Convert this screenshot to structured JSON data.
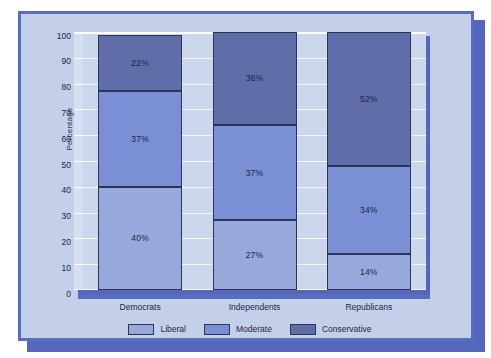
{
  "chart_data": {
    "type": "bar",
    "subtype": "stacked-100-percent",
    "title": "",
    "subtitle": "",
    "xlabel": "",
    "ylabel": "Percentage",
    "categories": [
      "Democrats",
      "Independents",
      "Republicans"
    ],
    "ylim": [
      0,
      100
    ],
    "yticks": [
      0,
      10,
      20,
      30,
      40,
      50,
      60,
      70,
      80,
      90,
      100
    ],
    "ytick_labels": [
      "0",
      "10",
      "20",
      "30",
      "40",
      "50",
      "60",
      "70",
      "80",
      "90",
      "100"
    ],
    "grid": true,
    "grid_orientation": "horizontal",
    "legend_position": "bottom-center",
    "stack_order": "bottom-to-top",
    "series": [
      {
        "name": "Liberal",
        "color": "#97a8dc",
        "values": [
          40,
          27,
          14
        ],
        "labels": [
          "40%",
          "27%",
          "14%"
        ]
      },
      {
        "name": "Moderate",
        "color": "#7b8fd4",
        "values": [
          37,
          37,
          34
        ],
        "labels": [
          "37%",
          "37%",
          "34%"
        ]
      },
      {
        "name": "Conservative",
        "color": "#5f6ea8",
        "values": [
          22,
          36,
          52
        ],
        "labels": [
          "22%",
          "36%",
          "52%"
        ]
      }
    ]
  },
  "legend": {
    "items": [
      {
        "label": "Liberal",
        "color": "#97a8dc"
      },
      {
        "label": "Moderate",
        "color": "#7b8fd4"
      },
      {
        "label": "Conservative",
        "color": "#5f6ea8"
      }
    ]
  },
  "axes": {
    "y_title": "Percentage",
    "y_tick_labels": [
      "100",
      "90",
      "80",
      "70",
      "60",
      "50",
      "40",
      "30",
      "20",
      "10",
      "0"
    ],
    "x_tick_labels": [
      "Democrats",
      "Independents",
      "Republicans"
    ]
  },
  "theme": {
    "panel_background": "#c4cfe9",
    "panel_border": "#5a6cc0",
    "plot_background": "#ccd6ec",
    "gridline_color": "#f2f6fd",
    "shadow_color": "#5566bd",
    "segment_border": "#2b3558",
    "text_color": "#1e2747"
  }
}
